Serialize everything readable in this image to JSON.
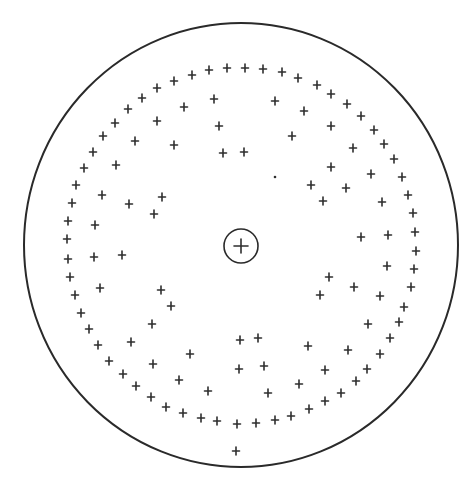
{
  "diagram": {
    "colors": {
      "stroke": "#2a2a2a",
      "background": "#ffffff"
    },
    "outer_circle": {
      "cx": 241,
      "cy": 245,
      "rx": 217,
      "ry": 222
    },
    "center": {
      "cx": 241,
      "cy": 246,
      "r": 17,
      "icon": "circled-plus-icon"
    },
    "marker_icon": "cross-icon",
    "outer_ring_markers": [
      [
        227,
        68
      ],
      [
        209,
        70
      ],
      [
        192,
        75
      ],
      [
        174,
        81
      ],
      [
        157,
        88
      ],
      [
        142,
        98
      ],
      [
        128,
        109
      ],
      [
        115,
        123
      ],
      [
        103,
        136
      ],
      [
        93,
        152
      ],
      [
        84,
        168
      ],
      [
        76,
        185
      ],
      [
        72,
        203
      ],
      [
        68,
        221
      ],
      [
        67,
        239
      ],
      [
        68,
        259
      ],
      [
        70,
        277
      ],
      [
        75,
        295
      ],
      [
        81,
        313
      ],
      [
        89,
        329
      ],
      [
        98,
        345
      ],
      [
        109,
        361
      ],
      [
        123,
        374
      ],
      [
        136,
        386
      ],
      [
        151,
        397
      ],
      [
        166,
        407
      ],
      [
        183,
        413
      ],
      [
        201,
        418
      ],
      [
        217,
        421
      ],
      [
        237,
        424
      ],
      [
        256,
        423
      ],
      [
        275,
        420
      ],
      [
        291,
        416
      ],
      [
        309,
        409
      ],
      [
        325,
        401
      ],
      [
        341,
        393
      ],
      [
        356,
        381
      ],
      [
        367,
        369
      ],
      [
        380,
        354
      ],
      [
        390,
        338
      ],
      [
        399,
        322
      ],
      [
        404,
        307
      ],
      [
        411,
        287
      ],
      [
        414,
        269
      ],
      [
        416,
        251
      ],
      [
        415,
        232
      ],
      [
        413,
        213
      ],
      [
        408,
        195
      ],
      [
        402,
        177
      ],
      [
        394,
        159
      ],
      [
        384,
        144
      ],
      [
        374,
        130
      ],
      [
        361,
        116
      ],
      [
        347,
        104
      ],
      [
        331,
        94
      ],
      [
        317,
        85
      ],
      [
        298,
        78
      ],
      [
        282,
        72
      ],
      [
        263,
        69
      ],
      [
        245,
        68
      ]
    ],
    "inner_markers": [
      [
        214,
        99
      ],
      [
        184,
        107
      ],
      [
        219,
        126
      ],
      [
        157,
        121
      ],
      [
        135,
        141
      ],
      [
        174,
        145
      ],
      [
        223,
        153
      ],
      [
        116,
        165
      ],
      [
        102,
        195
      ],
      [
        129,
        204
      ],
      [
        162,
        197
      ],
      [
        154,
        214
      ],
      [
        95,
        225
      ],
      [
        275,
        101
      ],
      [
        304,
        111
      ],
      [
        331,
        126
      ],
      [
        292,
        136
      ],
      [
        244,
        152
      ],
      [
        353,
        148
      ],
      [
        331,
        167
      ],
      [
        371,
        174
      ],
      [
        311,
        185
      ],
      [
        346,
        188
      ],
      [
        323,
        201
      ],
      [
        382,
        202
      ],
      [
        361,
        237
      ],
      [
        388,
        235
      ],
      [
        94,
        257
      ],
      [
        122,
        255
      ],
      [
        100,
        288
      ],
      [
        161,
        290
      ],
      [
        171,
        306
      ],
      [
        152,
        324
      ],
      [
        131,
        342
      ],
      [
        190,
        354
      ],
      [
        153,
        364
      ],
      [
        179,
        380
      ],
      [
        208,
        391
      ],
      [
        387,
        266
      ],
      [
        329,
        277
      ],
      [
        354,
        287
      ],
      [
        320,
        295
      ],
      [
        380,
        296
      ],
      [
        368,
        324
      ],
      [
        240,
        340
      ],
      [
        258,
        338
      ],
      [
        308,
        346
      ],
      [
        348,
        350
      ],
      [
        239,
        369
      ],
      [
        264,
        366
      ],
      [
        325,
        370
      ],
      [
        299,
        384
      ],
      [
        268,
        393
      ]
    ],
    "isolated_markers": [
      [
        236,
        451
      ]
    ],
    "dots": [
      [
        275,
        177
      ]
    ]
  }
}
